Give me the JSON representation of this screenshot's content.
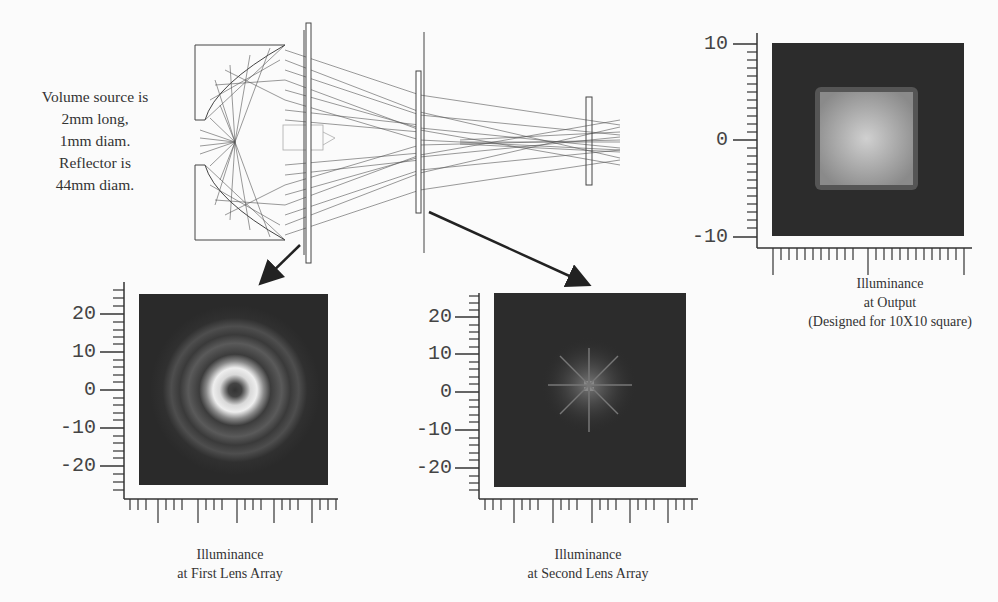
{
  "source_description": {
    "lines": [
      "Volume source is",
      "2mm long,",
      "1mm diam.",
      "Reflector is",
      "44mm diam."
    ]
  },
  "plots": {
    "output": {
      "caption": [
        "Illuminance",
        "at Output",
        "(Designed for 10X10 square)"
      ],
      "y_ticks": [
        "10",
        "0",
        "-10"
      ],
      "pattern": "uniform-square"
    },
    "first_lens_array": {
      "caption": [
        "Illuminance",
        "at First Lens Array"
      ],
      "y_ticks": [
        "20",
        "10",
        "0",
        "-10",
        "-20"
      ],
      "pattern": "concentric-rings"
    },
    "second_lens_array": {
      "caption": [
        "Illuminance",
        "at Second Lens Array"
      ],
      "y_ticks": [
        "20",
        "10",
        "0",
        "-10",
        "-20"
      ],
      "pattern": "spot-array"
    }
  },
  "colors": {
    "plot_bg": "#2a2a2a",
    "ray": "#555555",
    "axis": "#333333"
  }
}
